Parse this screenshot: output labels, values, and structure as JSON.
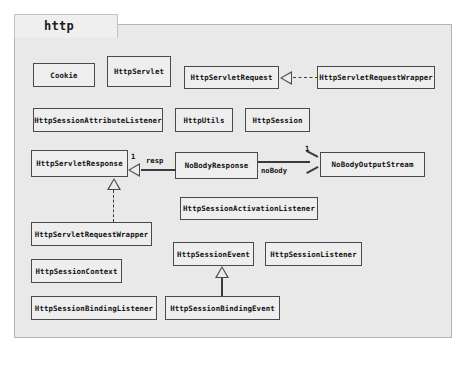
{
  "diagram": {
    "kind": "uml-class-diagram",
    "package_name": "http",
    "background_color": "#e9e9e9",
    "box_fill_color": "#eeeeee",
    "line_color": "#3a3a3a"
  },
  "classes": [
    {
      "id": "cookie",
      "label": "Cookie"
    },
    {
      "id": "http_servlet",
      "label": "HttpServlet"
    },
    {
      "id": "http_servlet_request",
      "label": "HttpServletRequest"
    },
    {
      "id": "http_servlet_request_wrapper_top",
      "label": "HttpServletRequestWrapper"
    },
    {
      "id": "http_session_attribute_listener",
      "label": "HttpSessionAttributeListener"
    },
    {
      "id": "http_utils",
      "label": "HttpUtils"
    },
    {
      "id": "http_session",
      "label": "HttpSession"
    },
    {
      "id": "http_servlet_response",
      "label": "HttpServletResponse"
    },
    {
      "id": "no_body_response",
      "label": "NoBodyResponse"
    },
    {
      "id": "no_body_output_stream",
      "label": "NoBodyOutputStream"
    },
    {
      "id": "http_session_activation_listener",
      "label": "HttpSessionActivationListener"
    },
    {
      "id": "http_servlet_request_wrapper",
      "label": "HttpServletRequestWrapper"
    },
    {
      "id": "http_session_event",
      "label": "HttpSessionEvent"
    },
    {
      "id": "http_session_listener",
      "label": "HttpSessionListener"
    },
    {
      "id": "http_session_context",
      "label": "HttpSessionContext"
    },
    {
      "id": "http_session_binding_listener",
      "label": "HttpSessionBindingListener"
    },
    {
      "id": "http_session_binding_event",
      "label": "HttpSessionBindingEvent"
    }
  ],
  "relationships": [
    {
      "id": "rel_request_wrapper",
      "type": "realization",
      "from": "HttpServletRequestWrapper",
      "to": "HttpServletRequest",
      "style": "dashed",
      "head": "hollow-triangle"
    },
    {
      "id": "rel_response_wrapper",
      "type": "realization",
      "from": "HttpServletRequestWrapper",
      "to": "HttpServletResponse",
      "style": "dashed",
      "head": "hollow-triangle"
    },
    {
      "id": "rel_nobodyresponse_response",
      "type": "generalization",
      "from": "NoBodyResponse",
      "to": "HttpServletResponse",
      "style": "solid",
      "head": "hollow-triangle",
      "role_label": "resp",
      "multiplicity": "1"
    },
    {
      "id": "rel_nobodyresponse_stream",
      "type": "association",
      "from": "NoBodyResponse",
      "to": "NoBodyOutputStream",
      "style": "solid",
      "head": "open-arrow",
      "role_label": "noBody",
      "multiplicity": "1"
    },
    {
      "id": "rel_bindingevent_sessionevent",
      "type": "generalization",
      "from": "HttpSessionBindingEvent",
      "to": "HttpSessionEvent",
      "style": "solid",
      "head": "hollow-triangle"
    }
  ],
  "edge_labels": {
    "resp": "resp",
    "resp_multiplicity": "1",
    "no_body": "noBody",
    "no_body_multiplicity": "1"
  }
}
